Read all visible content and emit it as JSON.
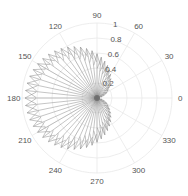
{
  "chart_data": {
    "type": "polar",
    "subtype": "compass-cardioid",
    "title": "",
    "theta_tick_labels": [
      "0",
      "30",
      "60",
      "90",
      "120",
      "150",
      "180",
      "210",
      "240",
      "270",
      "300",
      "330"
    ],
    "theta_ticks_deg": [
      0,
      30,
      60,
      90,
      120,
      150,
      180,
      210,
      240,
      270,
      300,
      330
    ],
    "r_tick_labels": [
      "0.2",
      "0.4",
      "0.6",
      "0.8",
      "1"
    ],
    "r_ticks": [
      0.2,
      0.4,
      0.6,
      0.8,
      1.0
    ],
    "rlim": [
      0,
      1
    ],
    "r_label_angle_deg": 80,
    "grid": true,
    "series": [
      {
        "name": "compass arrows",
        "description": "Arrows from origin along a cardioid-like envelope r ≈ 0.96*((1-cos θ)/2)^0.7, max ≈0.96 at 180°, ~0.6 at 90°/270°, ~0 at 0°",
        "angle_step_deg": 6,
        "r_max": 0.96,
        "shape_exponent": 0.7,
        "inner_ratio": 0.82
      }
    ],
    "colors": {
      "grid": "#e8e8e8",
      "line": "#8a8a8a",
      "tick_text": "#555555"
    }
  }
}
